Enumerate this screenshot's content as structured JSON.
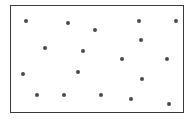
{
  "figure": {
    "frame": {
      "left": 10,
      "top": 5,
      "right": 184,
      "bottom": 113,
      "border_color": "#3a3a3a"
    },
    "dot_color": "#4a4a4a",
    "dots": [
      {
        "x": 26,
        "y": 21
      },
      {
        "x": 68,
        "y": 23
      },
      {
        "x": 95,
        "y": 30
      },
      {
        "x": 139,
        "y": 21
      },
      {
        "x": 176,
        "y": 21
      },
      {
        "x": 141,
        "y": 40
      },
      {
        "x": 45,
        "y": 48
      },
      {
        "x": 83,
        "y": 51
      },
      {
        "x": 122,
        "y": 59
      },
      {
        "x": 167,
        "y": 59
      },
      {
        "x": 23,
        "y": 74
      },
      {
        "x": 78,
        "y": 72
      },
      {
        "x": 142,
        "y": 79
      },
      {
        "x": 37,
        "y": 95
      },
      {
        "x": 64,
        "y": 95
      },
      {
        "x": 101,
        "y": 95
      },
      {
        "x": 131,
        "y": 99
      },
      {
        "x": 169,
        "y": 104
      }
    ]
  }
}
